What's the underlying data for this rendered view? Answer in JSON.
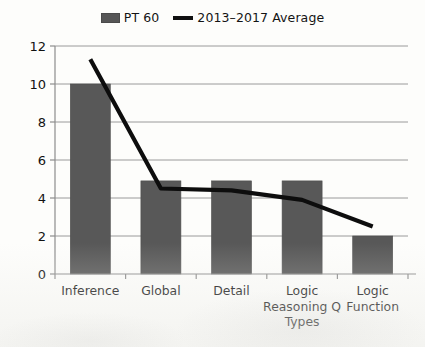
{
  "legend": {
    "entries": [
      {
        "label": "PT 60",
        "marker": "bar-swatch-icon",
        "color": "#585858"
      },
      {
        "label": "2013–2017 Average",
        "marker": "line-swatch-icon",
        "color": "#0d0d0d"
      }
    ]
  },
  "chart_data": {
    "type": "bar",
    "title": "",
    "subtitle": "",
    "xlabel": "",
    "ylabel": "",
    "ylim": [
      0,
      12
    ],
    "yticks": [
      0,
      2,
      4,
      6,
      8,
      10,
      12
    ],
    "ytick_labels": [
      "0",
      "2",
      "4",
      "6",
      "8",
      "10",
      "12"
    ],
    "grid": true,
    "legend_position": "top-center",
    "categories": [
      "Inference",
      "Global",
      "Detail",
      "Logic Reasoning Q Types",
      "Logic Function"
    ],
    "category_lines": [
      [
        "Inference"
      ],
      [
        "Global"
      ],
      [
        "Detail"
      ],
      [
        "Logic",
        "Reasoning Q",
        "Types"
      ],
      [
        "Logic",
        "Function"
      ]
    ],
    "series": [
      {
        "name": "PT 60",
        "type": "bar",
        "color": "#585858",
        "values": [
          10.0,
          4.9,
          4.9,
          4.9,
          2.0
        ]
      },
      {
        "name": "2013–2017 Average",
        "type": "line",
        "color": "#0d0d0d",
        "values": [
          11.3,
          4.5,
          4.4,
          3.9,
          2.5
        ]
      }
    ]
  }
}
